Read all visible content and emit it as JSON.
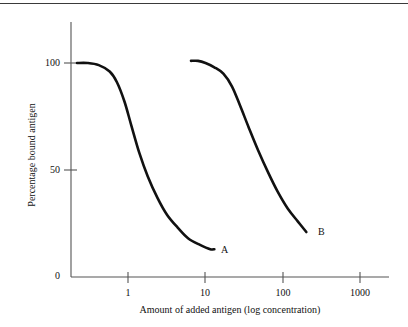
{
  "chart_data": {
    "type": "line",
    "title": "",
    "subtitle": "",
    "xlabel": "Amount of added antigen (log concentration)",
    "ylabel": "Percentage bound antigen",
    "x_scale": "log",
    "xlim": [
      0.2,
      2000
    ],
    "ylim": [
      0,
      110
    ],
    "xticks": [
      1,
      10,
      100,
      1000
    ],
    "xtick_labels": [
      "1",
      "10",
      "100",
      "1000"
    ],
    "yticks": [
      0,
      50,
      100
    ],
    "ytick_labels": [
      "0",
      "50",
      "100"
    ],
    "grid": false,
    "legend": "inline-end-labels",
    "series": [
      {
        "name": "A",
        "label": "A",
        "x": [
          0.22,
          0.3,
          0.42,
          0.58,
          0.72,
          0.9,
          1.1,
          1.4,
          1.8,
          2.4,
          3.2,
          4.4,
          6.0,
          8.5,
          11.5,
          13.0
        ],
        "y": [
          100,
          100,
          99,
          96,
          91,
          82,
          71,
          58,
          47,
          37,
          29,
          23,
          18,
          15,
          13,
          13
        ]
      },
      {
        "name": "B",
        "label": "B",
        "x": [
          6.5,
          8.0,
          10.0,
          13.0,
          17.0,
          22.0,
          28.0,
          36.0,
          48.0,
          64.0,
          85.0,
          115.0,
          155.0,
          200.0
        ],
        "y": [
          101,
          101,
          100,
          98,
          95,
          89,
          80,
          70,
          59,
          49,
          40,
          32,
          26,
          21
        ]
      }
    ],
    "annotations": [
      {
        "text": "A",
        "x": 15.5,
        "y": 13
      },
      {
        "text": "B",
        "x": 245,
        "y": 21
      }
    ]
  },
  "axes": {
    "ytick_0": "0",
    "ytick_50": "50",
    "ytick_100": "100",
    "xtick_1": "1",
    "xtick_10": "10",
    "xtick_100": "100",
    "xtick_1000": "1000",
    "ylabel": "Percentage bound antigen",
    "xlabel": "Amount of added antigen (log concentration)"
  },
  "curve_labels": {
    "a": "A",
    "b": "B"
  },
  "colors": {
    "ink": "#111111",
    "axis": "#555555",
    "rule": "#3a3a3a",
    "background": "#ffffff"
  }
}
